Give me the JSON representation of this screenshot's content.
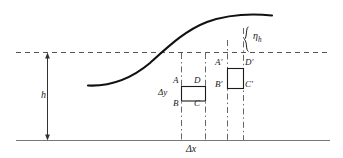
{
  "figure": {
    "type": "technical-diagram",
    "background_color": "#ffffff",
    "line_color": "#1a1a1a",
    "dash_color": "#555555",
    "ground_color": "#777777",
    "width": 343,
    "height": 158
  },
  "labels": {
    "depth": "h",
    "eta": "η",
    "eta_subscript": "h",
    "delta_y": "Δy",
    "delta_x": "Δx",
    "rect1": {
      "top_left": "A",
      "bottom_left": "B",
      "bottom_right": "C",
      "top_right": "D"
    },
    "rect2": {
      "top_left": "A′",
      "bottom_left": "B′",
      "bottom_right": "C′",
      "top_right": "D′"
    }
  },
  "geometry": {
    "baseline_y": 140,
    "still_water_level_y": 52,
    "curve_start": [
      88,
      85
    ],
    "curve_end": [
      272,
      15
    ],
    "vertical_dash_x": [
      181,
      205,
      227,
      243
    ],
    "rect1_box": [
      181,
      86,
      24,
      15
    ],
    "rect2_box": [
      227,
      68,
      16,
      20
    ],
    "depth_arrow_x": 47,
    "eta_brace_x": 250
  }
}
